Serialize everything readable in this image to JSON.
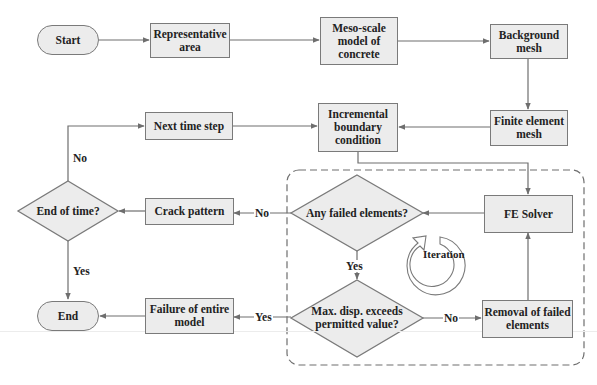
{
  "diagram": {
    "type": "flowchart",
    "colors": {
      "node_fill": "#ececec",
      "node_border": "#7a7a7a",
      "line": "#6e6e6e",
      "text": "#222222"
    },
    "nodes": {
      "start": "Start",
      "representative_area": "Representative area",
      "meso_scale_model": "Meso-scale model of concrete",
      "background_mesh": "Background mesh",
      "finite_element_mesh": "Finite element mesh",
      "incremental_boundary": "Incremental boundary condition",
      "next_time_step": "Next time step",
      "fe_solver": "FE Solver",
      "any_failed": "Any failed elements?",
      "crack_pattern": "Crack pattern",
      "end_of_time": "End of time?",
      "max_disp": "Max. disp. exceeds permitted value?",
      "removal_failed": "Removal of failed elements",
      "failure_entire": "Failure of entire model",
      "end": "End",
      "iteration": "Iteration"
    },
    "edge_labels": {
      "any_failed_no": "No",
      "any_failed_yes": "Yes",
      "end_of_time_no": "No",
      "end_of_time_yes": "Yes",
      "max_disp_no": "No",
      "max_disp_yes": "Yes"
    },
    "edges": [
      [
        "Start",
        "Representative area"
      ],
      [
        "Representative area",
        "Meso-scale model of concrete"
      ],
      [
        "Meso-scale model of concrete",
        "Background mesh"
      ],
      [
        "Background mesh",
        "Finite element mesh"
      ],
      [
        "Finite element mesh",
        "Incremental boundary condition"
      ],
      [
        "Incremental boundary condition",
        "FE Solver"
      ],
      [
        "Next time step",
        "Incremental boundary condition"
      ],
      [
        "FE Solver",
        "Any failed elements?"
      ],
      [
        "Any failed elements?",
        "Crack pattern",
        "No"
      ],
      [
        "Any failed elements?",
        "Max. disp. exceeds permitted value?",
        "Yes"
      ],
      [
        "Crack pattern",
        "End of time?"
      ],
      [
        "End of time?",
        "Next time step",
        "No"
      ],
      [
        "End of time?",
        "End",
        "Yes"
      ],
      [
        "Max. disp. exceeds permitted value?",
        "Removal of failed elements",
        "No"
      ],
      [
        "Max. disp. exceeds permitted value?",
        "Failure of entire model",
        "Yes"
      ],
      [
        "Removal of failed elements",
        "FE Solver"
      ],
      [
        "Failure of entire model",
        "End"
      ]
    ]
  }
}
